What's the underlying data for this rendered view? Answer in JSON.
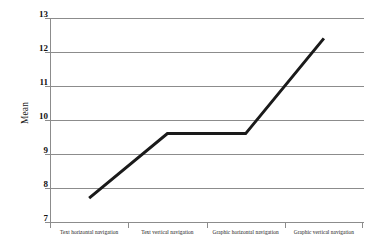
{
  "chart_data": {
    "type": "line",
    "title": "",
    "xlabel": "",
    "ylabel": "Mean",
    "categories": [
      "Text horizontal navigation",
      "Text vertical navigation",
      "Graphic horizontal navigation",
      "Graphic vertical navigation"
    ],
    "values": [
      7.7,
      9.6,
      9.6,
      12.4
    ],
    "series": [
      {
        "name": "Mean",
        "values": [
          7.7,
          9.6,
          9.6,
          12.4
        ]
      }
    ],
    "ylim": [
      7,
      13
    ],
    "ytick_labels": [
      "13",
      "12",
      "11",
      "10",
      "9",
      "8",
      "7"
    ],
    "ytick_values": [
      13,
      12,
      11,
      10,
      9,
      8,
      7
    ],
    "grid": "horizontal",
    "legend": "none",
    "line_color": "#1a1a1a",
    "gridline_color": "#8c8c8c",
    "background_color": "#ffffff"
  }
}
